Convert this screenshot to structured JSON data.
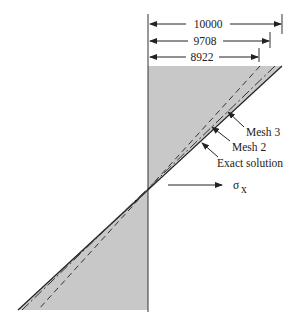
{
  "dimensions": {
    "top": "10000",
    "middle": "9708",
    "bottom": "8922"
  },
  "labels": {
    "mesh3": "Mesh 3",
    "mesh2": "Mesh 2",
    "exact": "Exact solution",
    "axis_symbol": "σ",
    "axis_subscript": "x"
  },
  "colors": {
    "shade": "#c8c8c8",
    "line": "#222222"
  }
}
